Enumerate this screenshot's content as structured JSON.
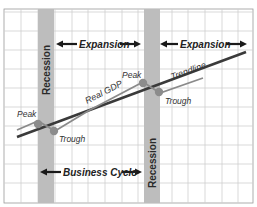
{
  "diagram": {
    "title": "Business Cycle",
    "labels": {
      "recession_1": "Recession",
      "recession_2": "Recession",
      "expansion_1": "Expansion",
      "expansion_2": "Expansion",
      "business_cycle": "Business Cycle",
      "real_gdp": "Real GDP",
      "trendline": "Trendline",
      "peak_1": "Peak",
      "peak_2": "Peak",
      "trough_1": "Trough",
      "trough_2": "Trough"
    },
    "colors": {
      "recession_band": "#b9b9b9",
      "grid": "#c8c8c8",
      "trendline": "#3a3a3a",
      "real_gdp": "#8a8a8a",
      "point": "#8c8c8c",
      "arrow": "#1a1a1a"
    }
  }
}
